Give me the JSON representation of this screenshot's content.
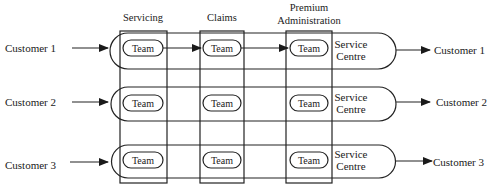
{
  "diagram": {
    "columns": [
      {
        "label": "Servicing",
        "lines": [
          "Servicing"
        ]
      },
      {
        "label": "Claims",
        "lines": [
          "Claims"
        ]
      },
      {
        "label": "Premium Administration",
        "lines": [
          "Premium",
          "Administration"
        ]
      }
    ],
    "rows": [
      {
        "input": "Customer 1",
        "output": "Customer 1",
        "teams": [
          "Team",
          "Team",
          "Team"
        ],
        "centre": [
          "Service",
          "Centre"
        ],
        "linked": true
      },
      {
        "input": "Customer 2",
        "output": "Customer 2",
        "teams": [
          "Team",
          "Team",
          "Team"
        ],
        "centre": [
          "Service",
          "Centre"
        ],
        "linked": false
      },
      {
        "input": "Customer 3",
        "output": "Customer 3",
        "teams": [
          "Team",
          "Team",
          "Team"
        ],
        "centre": [
          "Service",
          "Centre"
        ],
        "linked": false
      }
    ],
    "colors": {
      "ink": "#1a1a1a",
      "background": "#ffffff"
    }
  }
}
